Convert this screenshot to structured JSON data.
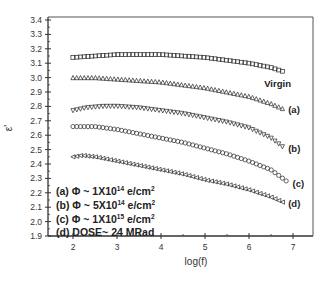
{
  "chart_data": {
    "type": "scatter",
    "title": "",
    "xlabel": "log(f)",
    "ylabel": "ε'",
    "xlim": [
      1.4,
      7.5
    ],
    "ylim": [
      1.9,
      3.4
    ],
    "xticks": [
      2,
      3,
      4,
      5,
      6,
      7
    ],
    "yticks": [
      1.9,
      2.0,
      2.1,
      2.2,
      2.3,
      2.4,
      2.5,
      2.6,
      2.7,
      2.8,
      2.9,
      3.0,
      3.1,
      3.2,
      3.3,
      3.4
    ],
    "grid": false,
    "legend_position": "lower-left (inside)",
    "legend": [
      "(a) Φ ~ 1X10^14 e/cm^2",
      "(b) Φ ~ 5X10^14 e/cm^2",
      "(c) Φ ~ 1X10^15 e/cm^2",
      "(d) DOSE~ 24 MRad"
    ],
    "series": [
      {
        "name": "Virgin",
        "marker": "square",
        "label": "Virgin",
        "x": [
          2.0,
          2.5,
          3.0,
          3.5,
          4.0,
          4.5,
          5.0,
          5.5,
          6.0,
          6.5,
          6.8
        ],
        "y": [
          3.14,
          3.15,
          3.16,
          3.16,
          3.16,
          3.15,
          3.14,
          3.12,
          3.1,
          3.07,
          3.04
        ]
      },
      {
        "name": "(a)",
        "marker": "triangle-up",
        "label": "(a)",
        "x": [
          2.0,
          2.5,
          3.0,
          3.5,
          4.0,
          4.5,
          5.0,
          5.5,
          6.0,
          6.5,
          6.8
        ],
        "y": [
          3.0,
          3.0,
          2.99,
          2.98,
          2.97,
          2.95,
          2.93,
          2.9,
          2.87,
          2.82,
          2.78
        ]
      },
      {
        "name": "(b)",
        "marker": "triangle-down",
        "label": "(b)",
        "x": [
          2.0,
          2.3,
          2.7,
          3.0,
          3.5,
          4.0,
          4.5,
          5.0,
          5.5,
          6.0,
          6.5,
          6.8
        ],
        "y": [
          2.77,
          2.79,
          2.8,
          2.8,
          2.79,
          2.77,
          2.75,
          2.72,
          2.69,
          2.65,
          2.58,
          2.51
        ]
      },
      {
        "name": "(c)",
        "marker": "circle",
        "label": "(c)",
        "x": [
          2.0,
          2.5,
          3.0,
          3.5,
          4.0,
          4.5,
          5.0,
          5.5,
          6.0,
          6.5,
          6.9
        ],
        "y": [
          2.66,
          2.66,
          2.64,
          2.61,
          2.58,
          2.55,
          2.51,
          2.47,
          2.42,
          2.36,
          2.27
        ]
      },
      {
        "name": "(d)",
        "marker": "triangle-left",
        "label": "(d)",
        "x": [
          2.0,
          2.2,
          2.5,
          3.0,
          3.5,
          4.0,
          4.5,
          5.0,
          5.5,
          6.0,
          6.5,
          6.8
        ],
        "y": [
          2.45,
          2.46,
          2.45,
          2.42,
          2.39,
          2.36,
          2.33,
          2.29,
          2.26,
          2.22,
          2.17,
          2.13
        ]
      }
    ]
  },
  "labels": {
    "xlabel": "log(f)",
    "ylabel": "ε'",
    "legend_a": "(a) Φ ~ 1X10",
    "legend_a_exp": "14",
    "legend_b": "(b) Φ ~ 5X10",
    "legend_b_exp": "14",
    "legend_c": "(c) Φ ~ 1X10",
    "legend_c_exp": "15",
    "legend_unit": " e/cm",
    "legend_unit_exp": "2",
    "legend_d": "(d) DOSE~ 24 MRad"
  }
}
